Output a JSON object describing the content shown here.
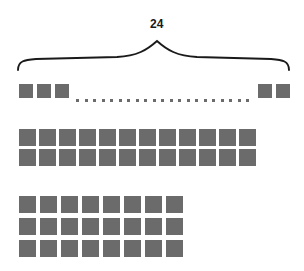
{
  "figure": {
    "kind": "array-model-diagram",
    "square_color": "#6b6b6b",
    "line_color": "#1a1a1a",
    "background": "#ffffff",
    "total": 24,
    "brace": {
      "label": "24",
      "label_x": 150,
      "label_y": 18,
      "left_x": 18,
      "right_x": 289,
      "peak_x": 157,
      "peak_y": 41,
      "baseline_y": 70
    },
    "groups": [
      {
        "name": "row-of-24-abbreviated",
        "caption": "24",
        "rows": 1,
        "columns": 24,
        "display": "abbreviated-with-ellipsis",
        "leading_squares": 3,
        "trailing_squares": 2,
        "ellipsis_dots": 21,
        "square_size": 14,
        "square_gap": 4,
        "origin_x": 19,
        "origin_y": 84,
        "trailing_origin_x": 258,
        "dots": {
          "start_x": 76,
          "end_x": 246,
          "y": 99,
          "size": 3
        }
      },
      {
        "name": "array-12-by-2",
        "rows": 2,
        "columns": 12,
        "total": 24,
        "square_size": 17,
        "square_gap_x": 3,
        "square_gap_y": 3,
        "origin_x": 19,
        "origin_y": 129
      },
      {
        "name": "array-8-by-3",
        "rows": 3,
        "columns": 8,
        "total": 24,
        "square_size": 17,
        "square_gap_x": 4,
        "square_gap_y": 5,
        "origin_x": 19,
        "origin_y": 196
      }
    ]
  }
}
